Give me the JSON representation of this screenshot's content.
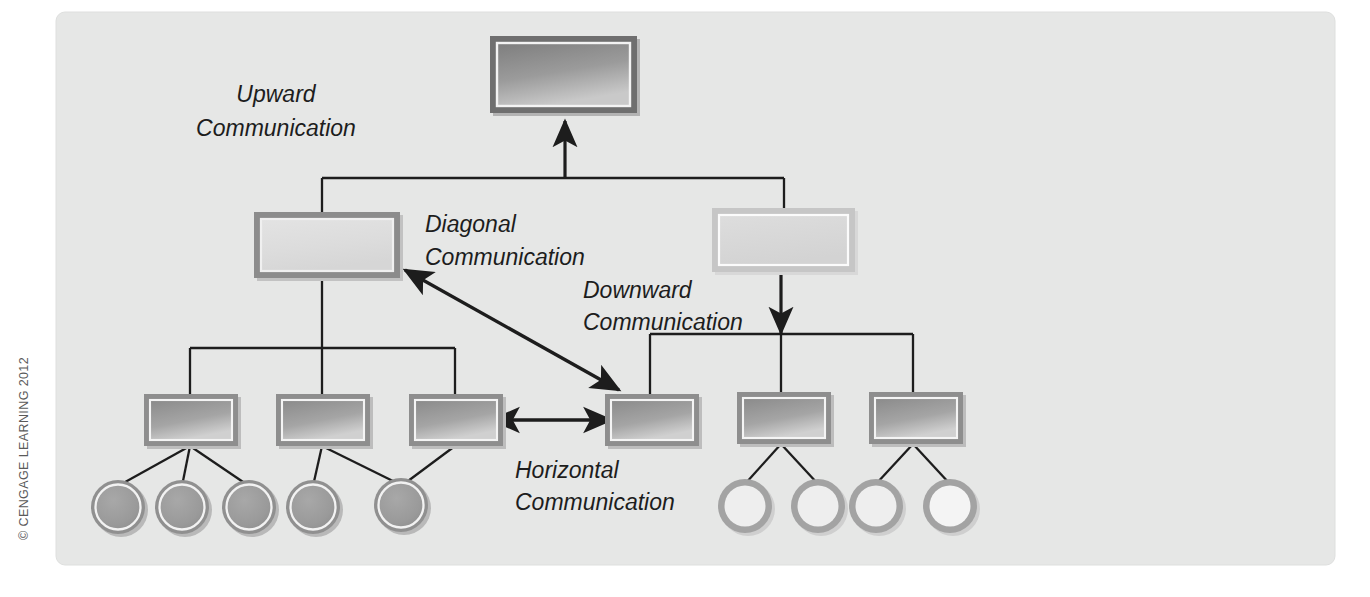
{
  "figure": {
    "type": "organizational-communication-diagram",
    "background_color": "#ffffff",
    "panel_color": "#e6e7e6",
    "ink_color": "#1d1d1d"
  },
  "copyright": {
    "text": "© CENGAGE LEARNING 2012"
  },
  "labels": [
    {
      "id": "upward",
      "line1": "Upward",
      "line2": "Communication"
    },
    {
      "id": "diagonal",
      "line1": "Diagonal",
      "line2": "Communication"
    },
    {
      "id": "downward",
      "line1": "Downward",
      "line2": "Communication"
    },
    {
      "id": "horizontal",
      "line1": "Horizontal",
      "line2": "Communication"
    }
  ],
  "nodes": {
    "top": {
      "name": "executive-box",
      "level": 1,
      "shade": "dark"
    },
    "level2": [
      {
        "name": "left-manager-box",
        "shade": "light"
      },
      {
        "name": "right-manager-box",
        "shade": "pale"
      }
    ],
    "level3": [
      {
        "name": "supervisor-box-1",
        "shade": "medium"
      },
      {
        "name": "supervisor-box-2",
        "shade": "medium"
      },
      {
        "name": "supervisor-box-3",
        "shade": "medium"
      },
      {
        "name": "supervisor-box-4",
        "shade": "medium"
      },
      {
        "name": "supervisor-box-5",
        "shade": "medium"
      },
      {
        "name": "supervisor-box-6",
        "shade": "medium"
      }
    ],
    "workers_left": [
      {
        "name": "worker-circle-1",
        "shade": "filled"
      },
      {
        "name": "worker-circle-2",
        "shade": "filled"
      },
      {
        "name": "worker-circle-3",
        "shade": "filled"
      },
      {
        "name": "worker-circle-4",
        "shade": "filled"
      },
      {
        "name": "worker-circle-5",
        "shade": "filled"
      }
    ],
    "workers_right": [
      {
        "name": "worker-circle-6",
        "shade": "hollow"
      },
      {
        "name": "worker-circle-7",
        "shade": "hollow"
      },
      {
        "name": "worker-circle-8",
        "shade": "hollow"
      },
      {
        "name": "worker-circle-9",
        "shade": "hollow"
      }
    ]
  },
  "arrows": [
    {
      "id": "upward-arrow",
      "direction": "up",
      "heads": 1
    },
    {
      "id": "downward-arrow",
      "direction": "down",
      "heads": 1
    },
    {
      "id": "diagonal-arrow",
      "direction": "diagonal",
      "heads": 2
    },
    {
      "id": "horizontal-arrow",
      "direction": "horizontal",
      "heads": 2
    }
  ]
}
